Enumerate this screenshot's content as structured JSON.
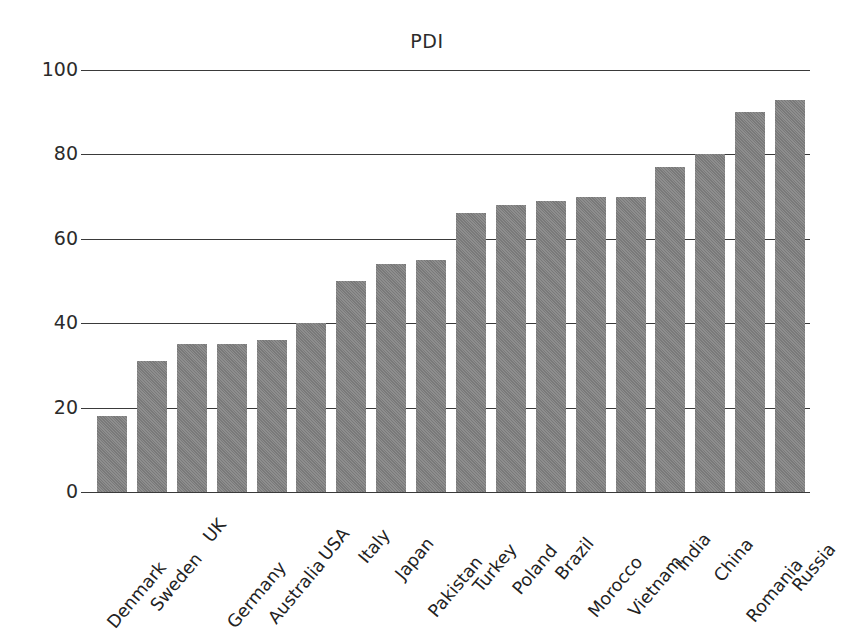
{
  "chart_data": {
    "type": "bar",
    "title": "PDI",
    "xlabel": "",
    "ylabel": "",
    "ylim": [
      0,
      100
    ],
    "yticks": [
      0,
      20,
      40,
      60,
      80,
      100
    ],
    "grid": true,
    "legend": "none",
    "orientation": "vertical",
    "bar_color": "#818181",
    "categories": [
      "Denmark",
      "Sweden",
      "UK",
      "Germany",
      "Australia",
      "USA",
      "Italy",
      "Japan",
      "Pakistan",
      "Turkey",
      "Poland",
      "Brazil",
      "Morocco",
      "Vietnam",
      "India",
      "China",
      "Romania",
      "Russia"
    ],
    "values": [
      18,
      31,
      35,
      35,
      36,
      40,
      50,
      54,
      55,
      66,
      68,
      69,
      70,
      70,
      77,
      80,
      90,
      93
    ]
  },
  "colors": {
    "bar": "#818181",
    "axis": "#3a3a3a",
    "text": "#222222",
    "background": "#ffffff"
  }
}
